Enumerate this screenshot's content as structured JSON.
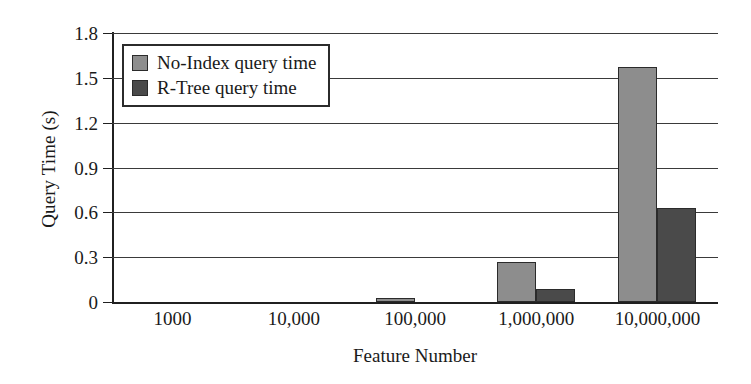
{
  "chart_data": {
    "type": "bar",
    "title": "",
    "xlabel": "Feature Number",
    "ylabel": "Query Time (s)",
    "categories": [
      "1000",
      "10,000",
      "100,000",
      "1,000,000",
      "10,000,000"
    ],
    "series": [
      {
        "name": "No-Index query time",
        "color": "#8d8d8d",
        "values": [
          0,
          0,
          0.03,
          0.27,
          1.57
        ]
      },
      {
        "name": "R-Tree query time",
        "color": "#4a4a4a",
        "values": [
          0,
          0,
          0,
          0.09,
          0.63
        ]
      }
    ],
    "ylim": [
      0,
      1.8
    ],
    "yticks": [
      "0",
      "0.3",
      "0.6",
      "0.9",
      "1.2",
      "1.5",
      "1.8"
    ],
    "ytick_values": [
      0,
      0.3,
      0.6,
      0.9,
      1.2,
      1.5,
      1.8
    ],
    "grid": true,
    "legend_position": "upper-left-inside",
    "axis_color": "#202020",
    "grid_color": "#3a3a3a",
    "background": "#ffffff"
  }
}
